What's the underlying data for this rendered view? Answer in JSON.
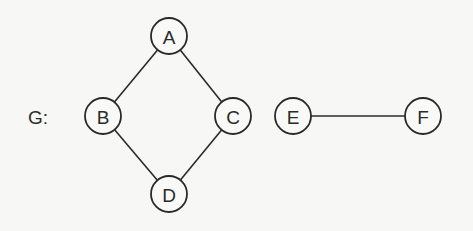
{
  "graph": {
    "label": "G:",
    "label_pos": {
      "x": 28,
      "y": 117
    },
    "node_radius": 18,
    "nodes": [
      {
        "id": "A",
        "label": "A",
        "x": 169,
        "y": 36
      },
      {
        "id": "B",
        "label": "B",
        "x": 103,
        "y": 116
      },
      {
        "id": "C",
        "label": "C",
        "x": 233,
        "y": 116
      },
      {
        "id": "D",
        "label": "D",
        "x": 169,
        "y": 194
      },
      {
        "id": "E",
        "label": "E",
        "x": 293,
        "y": 116
      },
      {
        "id": "F",
        "label": "F",
        "x": 423,
        "y": 116
      }
    ],
    "edges": [
      {
        "from": "A",
        "to": "B"
      },
      {
        "from": "A",
        "to": "C"
      },
      {
        "from": "B",
        "to": "D"
      },
      {
        "from": "C",
        "to": "D"
      },
      {
        "from": "E",
        "to": "F"
      }
    ]
  },
  "colors": {
    "background": "#f7f7f5",
    "stroke": "#2a2a2a"
  }
}
